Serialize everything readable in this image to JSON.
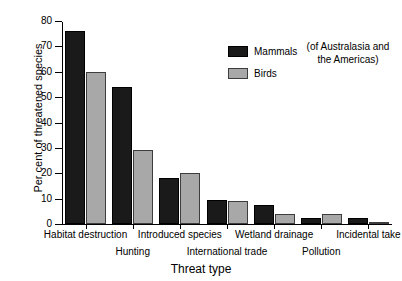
{
  "chart_data": {
    "type": "bar",
    "title": "",
    "xlabel": "Threat type",
    "ylabel": "Per cent of threatened species",
    "ylim": [
      0,
      80
    ],
    "yticks": [
      0,
      10,
      20,
      30,
      40,
      50,
      60,
      70,
      80
    ],
    "grid": false,
    "legend_position": "top-right",
    "annotation": "(of Australasia and the Americas)",
    "annotation_lines": [
      "(of Australasia and",
      "the Americas)"
    ],
    "categories": [
      "Habitat destruction",
      "Hunting",
      "Introduced species",
      "International trade",
      "Wetland drainage",
      "Pollution",
      "Incidental take"
    ],
    "series": [
      {
        "name": "Mammals",
        "color": "#1a1a1a",
        "values": [
          76,
          54,
          18,
          9.5,
          7.5,
          2.5,
          2.5
        ]
      },
      {
        "name": "Birds",
        "color": "#a8a8a8",
        "values": [
          60,
          29,
          20,
          9,
          4,
          3.8,
          0.8
        ]
      }
    ]
  },
  "legend": {
    "items": [
      {
        "label": "Mammals",
        "swatch": "mammals"
      },
      {
        "label": "Birds",
        "swatch": "birds"
      }
    ]
  }
}
